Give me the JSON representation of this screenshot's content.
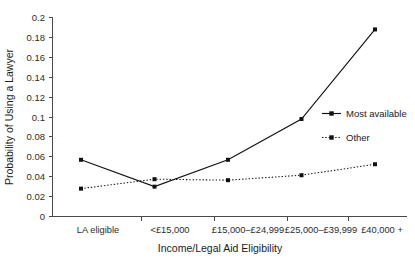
{
  "chart_data": {
    "type": "line",
    "title": "",
    "xlabel": "Income/Legal Aid Eligibility",
    "ylabel": "Probability of Using a Lawyer",
    "categories": [
      "LA eligible",
      "<£15,000",
      "£15,000–£24,999",
      "£25,000–£39,999",
      "£40,000 +"
    ],
    "series": [
      {
        "name": "Most available",
        "style": "solid",
        "marker": "square",
        "values": [
          0.057,
          0.03,
          0.057,
          0.098,
          0.188
        ]
      },
      {
        "name": "Other",
        "style": "dotted",
        "marker": "square",
        "values": [
          0.028,
          0.0375,
          0.0365,
          0.0415,
          0.0525
        ]
      }
    ],
    "ylim": [
      0,
      0.2
    ],
    "yticks": [
      0,
      0.02,
      0.04,
      0.06,
      0.08,
      0.1,
      0.12,
      0.14,
      0.16,
      0.18,
      0.2
    ],
    "ytick_labels": [
      "0",
      "0.02",
      "0.04",
      "0.06",
      "0.08",
      "0.1",
      "0.12",
      "0.14",
      "0.16",
      "0.18",
      "0.2"
    ],
    "grid": false,
    "legend_position": "right-middle",
    "line_color": "#111111",
    "axis_color": "#4a4a4a"
  },
  "axes": {
    "y_title": "Probability of Using a Lawyer",
    "x_title": "Income/Legal Aid Eligibility"
  },
  "ytick_labels": {
    "t0": "0",
    "t1": "0.02",
    "t2": "0.04",
    "t3": "0.06",
    "t4": "0.08",
    "t5": "0.1",
    "t6": "0.12",
    "t7": "0.14",
    "t8": "0.16",
    "t9": "0.18",
    "t10": "0.2"
  },
  "xtick_labels": {
    "c0": "LA eligible",
    "c1": "<£15,000",
    "c2": "£15,000–£24,999",
    "c3": "£25,000–£39,999",
    "c4": "£40,000 +"
  },
  "legend": {
    "entry_0": "Most available",
    "entry_1": "Other"
  }
}
